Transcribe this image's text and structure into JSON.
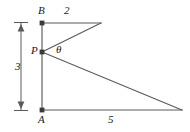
{
  "figure": {
    "type": "geometry-diagram",
    "stroke_color": "#5a5a5a",
    "label_color": "#1a1a1a",
    "background_color": "#ffffff",
    "points": {
      "B": {
        "label": "B",
        "x": 42,
        "y": 23
      },
      "P": {
        "label": "P",
        "x": 42,
        "y": 52
      },
      "A": {
        "label": "A",
        "x": 42,
        "y": 110
      },
      "top_apex": {
        "label": "",
        "x": 101,
        "y": 23
      },
      "bottom_apex": {
        "label": "",
        "x": 182,
        "y": 110
      }
    },
    "angle": {
      "label": "θ",
      "vertex": "P",
      "between": [
        "P-top_apex",
        "P-bottom_apex"
      ]
    },
    "measures": {
      "top_segment": {
        "label": "2",
        "from": "B",
        "to": "top_apex"
      },
      "left_segment": {
        "label": "3",
        "from": "A",
        "to": "B"
      },
      "bottom_segment": {
        "label": "5",
        "from": "A",
        "to": "bottom_apex"
      }
    },
    "dimension_line": {
      "label": "3",
      "x": 21,
      "y_top": 23,
      "y_bottom": 110,
      "arrowheads": "both"
    },
    "segments": [
      {
        "name": "AB-vertical",
        "from": "A",
        "to": "B"
      },
      {
        "name": "B-to-top-apex",
        "from": "B",
        "to": "top_apex"
      },
      {
        "name": "top-apex-to-P",
        "from": "top_apex",
        "to": "P"
      },
      {
        "name": "P-to-bottom-apex",
        "from": "P",
        "to": "bottom_apex"
      },
      {
        "name": "A-to-bottom-apex",
        "from": "A",
        "to": "bottom_apex"
      }
    ],
    "vertex_dots": [
      "B",
      "P",
      "A"
    ]
  }
}
